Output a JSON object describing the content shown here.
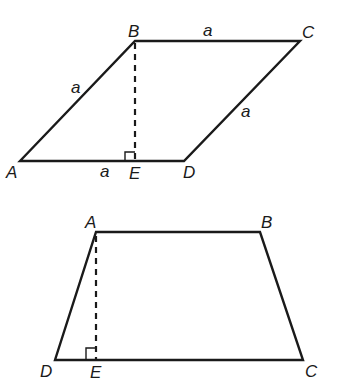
{
  "figures": [
    {
      "name": "rhombus",
      "vertices": {
        "A": {
          "label": "A",
          "x": 20,
          "y": 161
        },
        "B": {
          "label": "B",
          "x": 135,
          "y": 41
        },
        "C": {
          "label": "C",
          "x": 300,
          "y": 41
        },
        "D": {
          "label": "D",
          "x": 184,
          "y": 161
        },
        "E": {
          "label": "E",
          "x": 135,
          "y": 161
        }
      },
      "side_labels": {
        "AB": "a",
        "BC": "a",
        "CD": "a",
        "AE": "a"
      },
      "altitude": "BE",
      "right_angle_at": "E"
    },
    {
      "name": "trapezoid",
      "vertices": {
        "A": {
          "label": "A",
          "x": 96,
          "y": 232
        },
        "B": {
          "label": "B",
          "x": 260,
          "y": 232
        },
        "C": {
          "label": "C",
          "x": 303,
          "y": 360
        },
        "D": {
          "label": "D",
          "x": 55,
          "y": 360
        },
        "E": {
          "label": "E",
          "x": 96,
          "y": 360
        }
      },
      "altitude": "AE",
      "right_angle_at": "E"
    }
  ],
  "colors": {
    "stroke": "#1a1a1a",
    "background": "#ffffff"
  }
}
